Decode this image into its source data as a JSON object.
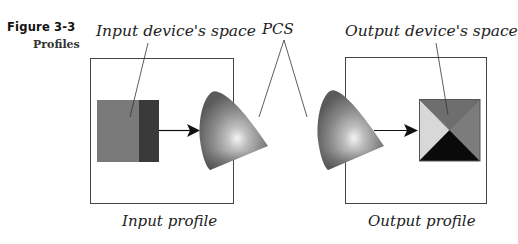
{
  "figure": {
    "number": "Figure 3-3",
    "title": "Profiles"
  },
  "labels": {
    "input_space": "Input device's space",
    "output_space": "Output device's space",
    "pcs": "PCS",
    "input_profile": "Input profile",
    "output_profile": "Output profile"
  },
  "colors": {
    "frame": "#444444",
    "input_swatch_light": "#7a7a7a",
    "input_swatch_dark": "#3a3a3a",
    "output_top": "#6e6e6e",
    "output_right": "#7c7c7c",
    "output_left": "#d8d8d8",
    "output_bottom": "#0a0a0a",
    "arrow": "#111111"
  }
}
